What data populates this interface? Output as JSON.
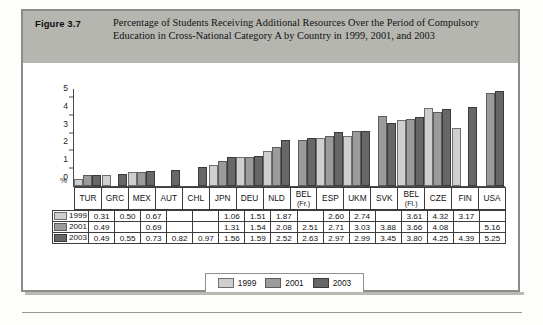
{
  "figure": {
    "number": "Figure 3.7",
    "caption": "Percentage of Students Receiving Additional Resources Over the Period of Compulsory Education in Cross-National Category A by Country in 1999, 2001, and 2003"
  },
  "legend": {
    "items": [
      {
        "label": "1999",
        "color": "#cfcfcf"
      },
      {
        "label": "2001",
        "color": "#9b9b9b"
      },
      {
        "label": "2003",
        "color": "#676767"
      }
    ]
  },
  "axis": {
    "ylabel": "%",
    "ticks": [
      "0",
      "1",
      "2",
      "3",
      "4",
      "5"
    ]
  },
  "table": {
    "row_labels": [
      "1999",
      "2001",
      "2003"
    ]
  },
  "chart_data": {
    "type": "bar",
    "title": "Percentage of Students Receiving Additional Resources Over the Period of Compulsory Education in Cross-National Category A by Country in 1999, 2001, and 2003",
    "xlabel": "",
    "ylabel": "%",
    "ylim": [
      0,
      5.5
    ],
    "yticks": [
      0,
      1,
      2,
      3,
      4,
      5
    ],
    "grid": false,
    "legend_position": "bottom",
    "categories": [
      "TUR",
      "GRC",
      "MEX",
      "AUT",
      "CHL",
      "JPN",
      "DEU",
      "NLD",
      "BEL (Fr.)",
      "ESP",
      "UKM",
      "SVK",
      "BEL (Fl.)",
      "CZE",
      "FIN",
      "USA"
    ],
    "category_sublabels": [
      "",
      "",
      "",
      "",
      "",
      "",
      "",
      "",
      "(Fr.)",
      "",
      "",
      "",
      "(Fl.)",
      "",
      "",
      ""
    ],
    "series": [
      {
        "name": "1999",
        "color": "#cfcfcf",
        "values": [
          0.31,
          0.5,
          0.67,
          null,
          null,
          1.06,
          1.51,
          1.87,
          null,
          2.6,
          2.74,
          null,
          3.61,
          4.32,
          3.17,
          null
        ]
      },
      {
        "name": "2001",
        "color": "#9b9b9b",
        "values": [
          0.49,
          null,
          0.69,
          null,
          null,
          1.31,
          1.54,
          2.08,
          2.51,
          2.71,
          3.03,
          3.88,
          3.66,
          4.08,
          null,
          5.16
        ]
      },
      {
        "name": "2003",
        "color": "#676767",
        "values": [
          0.49,
          0.55,
          0.73,
          0.82,
          0.97,
          1.56,
          1.59,
          2.52,
          2.63,
          2.97,
          2.99,
          3.45,
          3.8,
          4.25,
          4.39,
          5.25
        ]
      }
    ]
  }
}
